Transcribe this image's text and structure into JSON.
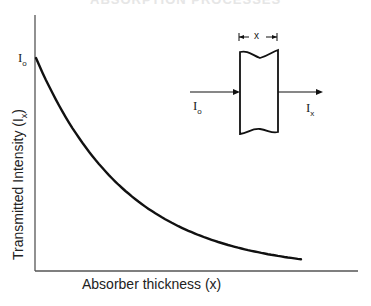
{
  "header_cut_text": "ABSORPTION PROCESSES",
  "chart_data": {
    "type": "line",
    "title": "",
    "xlabel": "Absorber thickness (x)",
    "ylabel": "Transmitted Intensity (I_x)",
    "y_tick_labels": [
      "I₀"
    ],
    "grid": false,
    "legend": null,
    "series": [
      {
        "name": "Transmitted intensity",
        "x": [
          0,
          0.1,
          0.2,
          0.3,
          0.4,
          0.5,
          0.6,
          0.7,
          0.8,
          0.9,
          1.0
        ],
        "values": [
          1.0,
          0.75,
          0.56,
          0.42,
          0.31,
          0.23,
          0.17,
          0.13,
          0.1,
          0.075,
          0.055
        ]
      }
    ],
    "xlim": [
      0,
      1.1
    ],
    "ylim": [
      0,
      1.2
    ]
  },
  "inset": {
    "incident_label": "I",
    "incident_sub": "o",
    "transmitted_label": "I",
    "transmitted_sub": "x",
    "thickness_label": "x"
  },
  "axes": {
    "y_tick": "I",
    "y_tick_sub": "o",
    "ylabel_main": "Transmitted Intensity (I",
    "ylabel_sub": "x",
    "ylabel_end": ")"
  }
}
